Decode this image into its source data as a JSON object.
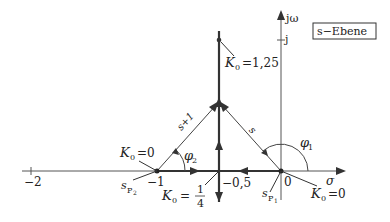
{
  "diagram": {
    "plane_label": "s−Ebene",
    "axes": {
      "real_axis_label": "σ",
      "imag_axis_label": "jω",
      "imag_tick_label": "j",
      "real_tick_labels": [
        "−2",
        "−1",
        "−0,5",
        "0"
      ]
    },
    "poles": [
      {
        "name": "s_P1",
        "label_main": "s",
        "label_sub": "P",
        "label_subsub": "1",
        "position": 0,
        "gain_label": "K₀ = 0"
      },
      {
        "name": "s_P2",
        "label_main": "s",
        "label_sub": "P",
        "label_subsub": "2",
        "position": -1,
        "gain_label": "K₀ = 0"
      }
    ],
    "breakaway": {
      "position": -0.5,
      "gain_label_prefix": "K",
      "gain_label_sub": "0",
      "gain_label_eq": "=",
      "gain_num": "1",
      "gain_den": "4"
    },
    "upper_point": {
      "gain_label_prefix": "K",
      "gain_label_sub": "0",
      "gain_label_value": "=1,25"
    },
    "vectors": [
      {
        "label": "s+1",
        "from": -1,
        "angle_label": "φ",
        "angle_sub": "2"
      },
      {
        "label": "s",
        "from": 0,
        "angle_label": "φ",
        "angle_sub": "1"
      }
    ],
    "k0_zero_left": {
      "prefix": "K",
      "sub": "0",
      "value": "=0"
    },
    "k0_zero_right": {
      "prefix": "K",
      "sub": "0",
      "value": "=0"
    },
    "colors": {
      "axis": "#555555",
      "locus": "#333333",
      "text": "#222222"
    }
  }
}
